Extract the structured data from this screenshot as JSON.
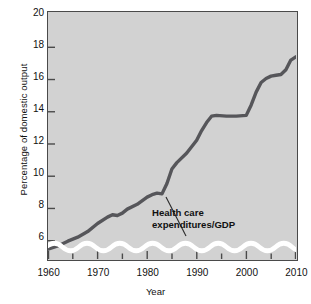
{
  "chart_data": {
    "type": "line",
    "title": "",
    "xlabel": "Year",
    "ylabel": "Percentage of domestic output",
    "xlim": [
      1960,
      2010
    ],
    "ylim": [
      4.6,
      20
    ],
    "grid": false,
    "legend": "none",
    "axis_break": true,
    "axis_break_note": "wavy white band at bottom of plot indicates the vertical scale does not start at zero",
    "yticks": [
      6,
      8,
      10,
      12,
      14,
      16,
      18,
      20
    ],
    "ytick_labels": [
      "6",
      "8",
      "10",
      "12",
      "14",
      "16",
      "18",
      "20"
    ],
    "xticks": [
      1960,
      1970,
      1980,
      1990,
      2000,
      2010
    ],
    "xtick_labels": [
      "1960",
      "1970",
      "1980",
      "1990",
      "2000",
      "2010"
    ],
    "xminor_ticks": [
      1965,
      1975,
      1985,
      1995,
      2005
    ],
    "line_color": "#56565a",
    "plot_background": "#d2d2d2",
    "series": [
      {
        "name": "Health care expenditures/GDP",
        "x": [
          1960,
          1962,
          1964,
          1966,
          1968,
          1970,
          1972,
          1973,
          1974,
          1975,
          1976,
          1978,
          1980,
          1981,
          1982,
          1983,
          1984,
          1985,
          1986,
          1988,
          1990,
          1991,
          1992,
          1993,
          1994,
          1996,
          1998,
          2000,
          2001,
          2002,
          2003,
          2004,
          2005,
          2006,
          2007,
          2008,
          2009,
          2010
        ],
        "values": [
          5.2,
          5.4,
          5.7,
          5.95,
          6.3,
          6.8,
          7.2,
          7.35,
          7.3,
          7.45,
          7.7,
          8.0,
          8.45,
          8.6,
          8.7,
          8.65,
          9.3,
          10.2,
          10.6,
          11.2,
          12.0,
          12.6,
          13.1,
          13.5,
          13.55,
          13.5,
          13.5,
          13.55,
          14.2,
          15.0,
          15.6,
          15.85,
          16.0,
          16.05,
          16.1,
          16.4,
          17.0,
          17.2
        ]
      }
    ],
    "annotations": [
      {
        "text_line1": "Health care",
        "text_line2": "expenditures/GDP",
        "points_to_year": 1983,
        "points_to_value": 8.7,
        "bold": true,
        "leader_line": true
      }
    ]
  },
  "axis": {
    "ylabel": "Percentage of domestic output",
    "xlabel": "Year"
  }
}
